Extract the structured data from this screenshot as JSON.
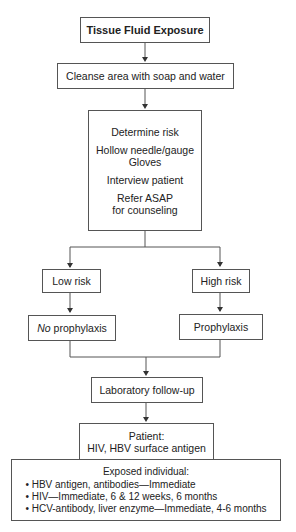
{
  "flowchart": {
    "start": "Tissue Fluid Exposure",
    "cleanse": "Cleanse area with soap and water",
    "determine": {
      "title": "Determine risk",
      "line1a": "Hollow needle/gauge",
      "line1b": "Gloves",
      "line2": "Interview patient",
      "line3a": "Refer ASAP",
      "line3b": "for counseling"
    },
    "low_risk": "Low risk",
    "high_risk": "High risk",
    "no_prophylaxis": {
      "emph": "No",
      "rest": " prophylaxis"
    },
    "prophylaxis": "Prophylaxis",
    "lab": "Laboratory follow-up",
    "patient": {
      "title": "Patient:",
      "detail": "HIV, HBV surface antigen"
    },
    "exposed": {
      "title": "Exposed individual:",
      "items": [
        "• HBV antigen, antibodies—Immediate",
        "• HIV—Immediate, 6 & 12 weeks, 6 months",
        "• HCV-antibody, liver enzyme—Immediate, 4-6 months"
      ]
    }
  }
}
